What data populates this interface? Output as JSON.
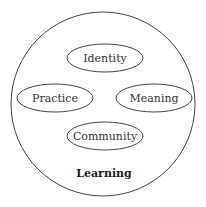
{
  "diagram": {
    "container": {
      "label": "Learning",
      "shape": "circle"
    },
    "nodes": [
      {
        "id": "identity",
        "label": "Identity",
        "shape": "ellipse"
      },
      {
        "id": "practice",
        "label": "Practice",
        "shape": "ellipse"
      },
      {
        "id": "meaning",
        "label": "Meaning",
        "shape": "ellipse"
      },
      {
        "id": "community",
        "label": "Community",
        "shape": "ellipse"
      }
    ],
    "colors": {
      "stroke": "#444444",
      "text": "#333333",
      "background": "#ffffff"
    }
  }
}
